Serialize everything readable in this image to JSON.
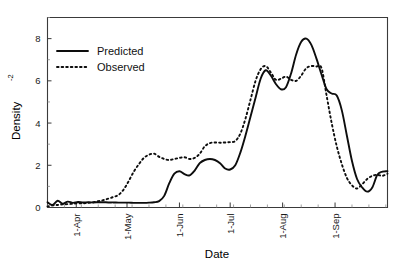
{
  "chart_data": {
    "type": "line",
    "title": "",
    "xlabel": "Date",
    "ylabel": "Density",
    "ylabel_superscript": "-2",
    "ylim": [
      0,
      9
    ],
    "yticks": [
      0,
      2,
      4,
      6,
      8
    ],
    "ytick_labels": [
      "0",
      "2",
      "4",
      "6",
      "8"
    ],
    "grid": false,
    "legend_position": "top-left",
    "xtick_labels": [
      "1-Apr",
      "1-May",
      "1-Jun",
      "1-Jul",
      "1-Aug",
      "1-Sep"
    ],
    "xticks_days": [
      31,
      61,
      92,
      122,
      153,
      184
    ],
    "x_minor_interval_days": 10,
    "xlim_days": [
      14,
      215
    ],
    "series": [
      {
        "name": "Predicted",
        "style": "solid",
        "color": "#0d0d0d",
        "x": [
          14,
          17,
          20,
          23,
          26,
          29,
          32,
          35,
          38,
          41,
          44,
          47,
          50,
          53,
          56,
          59,
          62,
          65,
          68,
          71,
          74,
          77,
          80,
          83,
          86,
          89,
          92,
          95,
          98,
          101,
          104,
          107,
          110,
          113,
          116,
          119,
          122,
          125,
          128,
          131,
          134,
          137,
          140,
          143,
          146,
          149,
          152,
          155,
          158,
          161,
          164,
          167,
          170,
          173,
          176,
          179,
          182,
          185,
          188,
          191,
          194,
          197,
          200,
          203,
          206,
          209,
          212,
          215
        ],
        "y": [
          0.25,
          0.12,
          0.32,
          0.18,
          0.28,
          0.22,
          0.26,
          0.24,
          0.25,
          0.24,
          0.25,
          0.25,
          0.24,
          0.24,
          0.23,
          0.23,
          0.23,
          0.22,
          0.22,
          0.22,
          0.23,
          0.25,
          0.3,
          0.55,
          1.15,
          1.6,
          1.72,
          1.58,
          1.52,
          1.75,
          2.1,
          2.25,
          2.3,
          2.25,
          2.1,
          1.85,
          1.8,
          2.0,
          2.6,
          3.4,
          4.3,
          5.2,
          6.1,
          6.5,
          6.25,
          5.85,
          5.6,
          5.7,
          6.35,
          7.25,
          7.85,
          8.0,
          7.7,
          7.05,
          6.3,
          5.6,
          5.4,
          5.3,
          4.6,
          3.4,
          2.2,
          1.35,
          0.95,
          0.75,
          0.95,
          1.55,
          1.7,
          1.72
        ]
      },
      {
        "name": "Observed",
        "style": "dotted",
        "color": "#0d0d0d",
        "x": [
          14,
          17,
          20,
          23,
          26,
          29,
          32,
          35,
          38,
          41,
          44,
          47,
          50,
          53,
          56,
          59,
          62,
          65,
          68,
          71,
          74,
          77,
          80,
          83,
          86,
          89,
          92,
          95,
          98,
          101,
          104,
          107,
          110,
          113,
          116,
          119,
          122,
          125,
          128,
          131,
          134,
          137,
          140,
          143,
          146,
          149,
          152,
          155,
          158,
          161,
          164,
          167,
          170,
          173,
          176,
          179,
          182,
          185,
          188,
          191,
          194,
          197,
          200,
          203,
          206,
          209,
          212,
          215
        ],
        "y": [
          0.05,
          0.1,
          0.12,
          0.15,
          0.16,
          0.18,
          0.2,
          0.2,
          0.22,
          0.25,
          0.3,
          0.35,
          0.42,
          0.5,
          0.6,
          0.85,
          1.25,
          1.7,
          2.05,
          2.35,
          2.5,
          2.55,
          2.4,
          2.3,
          2.25,
          2.3,
          2.35,
          2.38,
          2.3,
          2.35,
          2.55,
          2.9,
          3.05,
          3.08,
          3.07,
          3.08,
          3.1,
          3.15,
          3.5,
          4.2,
          5.1,
          6.0,
          6.55,
          6.7,
          6.4,
          6.05,
          6.1,
          6.2,
          6.05,
          6.0,
          6.25,
          6.6,
          6.7,
          6.68,
          6.6,
          5.3,
          4.0,
          2.9,
          2.05,
          1.4,
          1.05,
          0.9,
          1.1,
          1.35,
          1.5,
          1.55,
          1.5,
          1.6
        ]
      }
    ]
  },
  "legend": {
    "items": [
      {
        "label": "Predicted",
        "style": "solid"
      },
      {
        "label": "Observed",
        "style": "dotted"
      }
    ]
  },
  "axes": {
    "x_title": "Date",
    "y_title": "Density",
    "y_title_superscript": "-2"
  }
}
